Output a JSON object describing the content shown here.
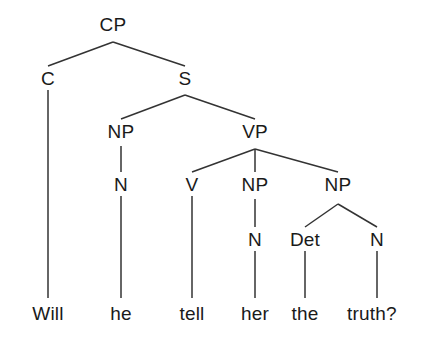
{
  "figure": {
    "type": "syntax-tree",
    "sentence": "Will he tell her the truth?",
    "background_color": "#ffffff",
    "line_color": "#333333",
    "text_color": "#1a1a1a"
  },
  "nodes": [
    {
      "id": "CP",
      "label": "CP",
      "x": 113,
      "y": 24
    },
    {
      "id": "C",
      "label": "C",
      "x": 48,
      "y": 78
    },
    {
      "id": "S",
      "label": "S",
      "x": 185,
      "y": 78
    },
    {
      "id": "NP1",
      "label": "NP",
      "x": 121,
      "y": 131
    },
    {
      "id": "VP",
      "label": "VP",
      "x": 255,
      "y": 131
    },
    {
      "id": "N1",
      "label": "N",
      "x": 121,
      "y": 184
    },
    {
      "id": "V",
      "label": "V",
      "x": 192,
      "y": 184
    },
    {
      "id": "NP2",
      "label": "NP",
      "x": 255,
      "y": 184
    },
    {
      "id": "NP3",
      "label": "NP",
      "x": 338,
      "y": 184
    },
    {
      "id": "N2",
      "label": "N",
      "x": 255,
      "y": 239
    },
    {
      "id": "Det",
      "label": "Det",
      "x": 305,
      "y": 239
    },
    {
      "id": "N3",
      "label": "N",
      "x": 377,
      "y": 239
    }
  ],
  "terminals": [
    {
      "id": "w-will",
      "label": "Will",
      "x": 48,
      "y": 313
    },
    {
      "id": "w-he",
      "label": "he",
      "x": 121,
      "y": 313
    },
    {
      "id": "w-tell",
      "label": "tell",
      "x": 192,
      "y": 313
    },
    {
      "id": "w-her",
      "label": "her",
      "x": 255,
      "y": 313
    },
    {
      "id": "w-the",
      "label": "the",
      "x": 305,
      "y": 313
    },
    {
      "id": "w-truth",
      "label": "truth?",
      "x": 372,
      "y": 313
    }
  ],
  "edges": [
    {
      "from": "CP",
      "to": "C",
      "x1": 113,
      "y1": 42,
      "x2": 48,
      "y2": 66
    },
    {
      "from": "CP",
      "to": "S",
      "x1": 113,
      "y1": 42,
      "x2": 185,
      "y2": 66
    },
    {
      "from": "C",
      "to": "w-will",
      "x1": 48,
      "y1": 90,
      "x2": 48,
      "y2": 298
    },
    {
      "from": "S",
      "to": "NP1",
      "x1": 185,
      "y1": 95,
      "x2": 121,
      "y2": 119
    },
    {
      "from": "S",
      "to": "VP",
      "x1": 185,
      "y1": 95,
      "x2": 255,
      "y2": 119
    },
    {
      "from": "NP1",
      "to": "N1",
      "x1": 121,
      "y1": 146,
      "x2": 121,
      "y2": 172
    },
    {
      "from": "VP",
      "to": "V",
      "x1": 255,
      "y1": 149,
      "x2": 192,
      "y2": 172
    },
    {
      "from": "VP",
      "to": "NP2",
      "x1": 255,
      "y1": 149,
      "x2": 255,
      "y2": 172
    },
    {
      "from": "VP",
      "to": "NP3",
      "x1": 255,
      "y1": 149,
      "x2": 338,
      "y2": 172
    },
    {
      "from": "N1",
      "to": "w-he",
      "x1": 121,
      "y1": 196,
      "x2": 121,
      "y2": 298
    },
    {
      "from": "V",
      "to": "w-tell",
      "x1": 192,
      "y1": 196,
      "x2": 192,
      "y2": 298
    },
    {
      "from": "NP2",
      "to": "N2",
      "x1": 255,
      "y1": 199,
      "x2": 255,
      "y2": 227
    },
    {
      "from": "NP3",
      "to": "Det",
      "x1": 338,
      "y1": 204,
      "x2": 305,
      "y2": 227
    },
    {
      "from": "NP3",
      "to": "N3",
      "x1": 338,
      "y1": 204,
      "x2": 377,
      "y2": 227
    },
    {
      "from": "N2",
      "to": "w-her",
      "x1": 255,
      "y1": 251,
      "x2": 255,
      "y2": 298
    },
    {
      "from": "Det",
      "to": "w-the",
      "x1": 305,
      "y1": 251,
      "x2": 305,
      "y2": 298
    },
    {
      "from": "N3",
      "to": "w-truth",
      "x1": 377,
      "y1": 251,
      "x2": 377,
      "y2": 298
    }
  ]
}
